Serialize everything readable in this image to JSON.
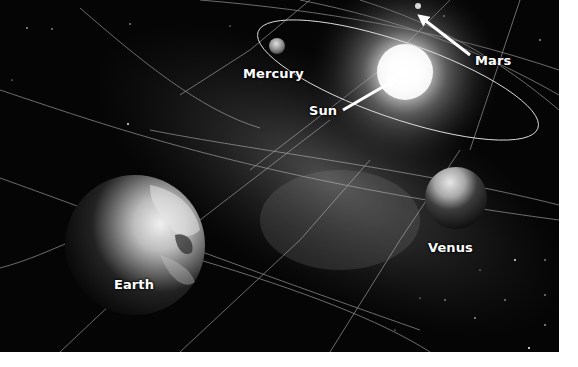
{
  "diagram": {
    "title": "",
    "background_color": "#050505",
    "labels": {
      "mercury": "Mercury",
      "sun": "Sun",
      "mars": "Mars",
      "venus": "Venus",
      "earth": "Earth"
    },
    "bodies": [
      {
        "name": "Sun",
        "cx": 405,
        "cy": 72,
        "glow_radius": 95
      },
      {
        "name": "Mercury",
        "cx": 277,
        "cy": 46,
        "r": 8
      },
      {
        "name": "Mars",
        "cx": 418,
        "cy": 6,
        "r": 3
      },
      {
        "name": "Venus",
        "cx": 456,
        "cy": 198,
        "r": 31
      },
      {
        "name": "Earth",
        "cx": 135,
        "cy": 245,
        "r": 70
      }
    ],
    "arrows": [
      {
        "target": "Sun",
        "from": [
          343,
          110
        ],
        "to": [
          395,
          80
        ]
      },
      {
        "target": "Mars",
        "from": [
          470,
          55
        ],
        "to": [
          420,
          17
        ]
      }
    ]
  }
}
